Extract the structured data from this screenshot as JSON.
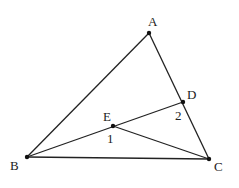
{
  "diagram": {
    "type": "geometry-triangle",
    "points": {
      "A": {
        "label": "A",
        "x": 149,
        "y": 33,
        "lx": 148,
        "ly": 26
      },
      "B": {
        "label": "B",
        "x": 27,
        "y": 157,
        "lx": 10,
        "ly": 170
      },
      "C": {
        "label": "C",
        "x": 209,
        "y": 159,
        "lx": 214,
        "ly": 171
      },
      "D": {
        "label": "D",
        "x": 183,
        "y": 102,
        "lx": 187,
        "ly": 99
      },
      "E": {
        "label": "E",
        "x": 113,
        "y": 126,
        "lx": 103,
        "ly": 121
      }
    },
    "segments": [
      {
        "from": "A",
        "to": "B"
      },
      {
        "from": "A",
        "to": "C"
      },
      {
        "from": "B",
        "to": "C"
      },
      {
        "from": "B",
        "to": "D"
      },
      {
        "from": "E",
        "to": "C"
      }
    ],
    "angle_labels": [
      {
        "label": "1",
        "x": 107,
        "y": 143
      },
      {
        "label": "2",
        "x": 175,
        "y": 120
      }
    ]
  }
}
